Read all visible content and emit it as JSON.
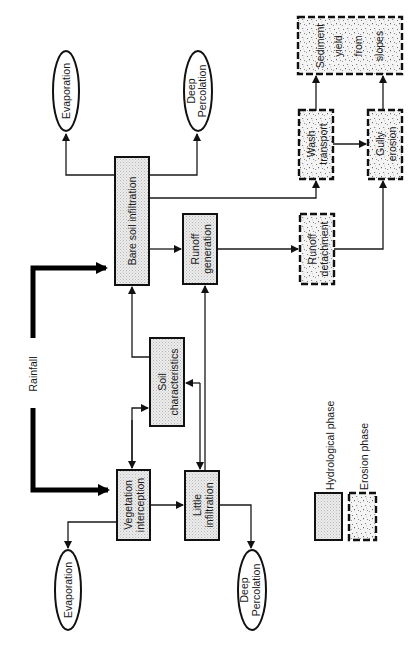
{
  "diagram": {
    "orientation": "rotated-90-ccw",
    "input": {
      "label": "Rainfall"
    },
    "nodes": {
      "vegetation_interception": {
        "lines": [
          "Vegetation",
          "interception"
        ],
        "phase": "hydrological"
      },
      "little_infiltration": {
        "lines": [
          "Little",
          "infiltration"
        ],
        "phase": "hydrological"
      },
      "soil_characteristics": {
        "lines": [
          "Soil",
          "characteristics"
        ],
        "phase": "hydrological"
      },
      "bare_soil_infiltration": {
        "lines": [
          "Bare soil infiltration"
        ],
        "phase": "hydrological"
      },
      "runoff_generation": {
        "lines": [
          "Runoff",
          "generation"
        ],
        "phase": "hydrological"
      },
      "runoff_detachment": {
        "lines": [
          "Runoff",
          "detachment"
        ],
        "phase": "erosion"
      },
      "wash_transport": {
        "lines": [
          "Wash",
          "transport"
        ],
        "phase": "erosion"
      },
      "gully_erosion": {
        "lines": [
          "Gully",
          "erosion"
        ],
        "phase": "erosion"
      },
      "sediment_yield": {
        "lines": [
          "Sediment",
          "yield",
          "from",
          "slopes"
        ],
        "phase": "erosion"
      },
      "evaporation_top": {
        "lines": [
          "Evaporation"
        ],
        "shape": "oval"
      },
      "deep_percolation_top": {
        "lines": [
          "Deep",
          "Percolation"
        ],
        "shape": "oval"
      },
      "evaporation_bottom": {
        "lines": [
          "Evaporation"
        ],
        "shape": "oval"
      },
      "deep_percolation_bottom": {
        "lines": [
          "Deep",
          "Percolation"
        ],
        "shape": "oval"
      }
    },
    "edges": [
      {
        "from": "Rainfall",
        "to": "bare_soil_infiltration",
        "style": "thick"
      },
      {
        "from": "Rainfall",
        "to": "vegetation_interception",
        "style": "thick"
      },
      {
        "from": "bare_soil_infiltration",
        "to": "evaporation_top"
      },
      {
        "from": "bare_soil_infiltration",
        "to": "deep_percolation_top"
      },
      {
        "from": "bare_soil_infiltration",
        "to": "runoff_generation"
      },
      {
        "from": "bare_soil_infiltration",
        "to": "wash_transport"
      },
      {
        "from": "soil_characteristics",
        "to": "bare_soil_infiltration"
      },
      {
        "from": "soil_characteristics",
        "to": "vegetation_interception",
        "bidirectional": true
      },
      {
        "from": "soil_characteristics",
        "to": "little_infiltration",
        "bidirectional": true
      },
      {
        "from": "little_infiltration",
        "to": "runoff_generation"
      },
      {
        "from": "vegetation_interception",
        "to": "little_infiltration"
      },
      {
        "from": "vegetation_interception",
        "to": "evaporation_bottom"
      },
      {
        "from": "little_infiltration",
        "to": "deep_percolation_bottom"
      },
      {
        "from": "runoff_generation",
        "to": "runoff_detachment"
      },
      {
        "from": "runoff_detachment",
        "to": "gully_erosion"
      },
      {
        "from": "wash_transport",
        "to": "gully_erosion"
      },
      {
        "from": "wash_transport",
        "to": "sediment_yield"
      },
      {
        "from": "gully_erosion",
        "to": "sediment_yield"
      }
    ]
  },
  "legend": {
    "hydrological": "Hydrological phase",
    "erosion": "Erosion phase"
  }
}
